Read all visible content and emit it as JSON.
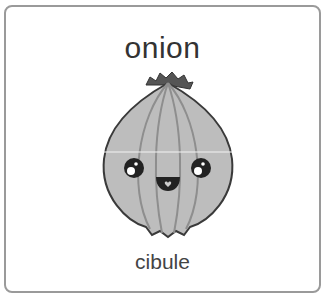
{
  "card": {
    "word": "onion",
    "translation": "cibule",
    "image": {
      "icon": "onion-icon",
      "description": "cartoon smiling onion"
    },
    "colors": {
      "border": "#9a9a9a",
      "onion_fill": "#bdbdbd",
      "onion_stroke": "#3a3a3a",
      "text": "#333333"
    }
  }
}
